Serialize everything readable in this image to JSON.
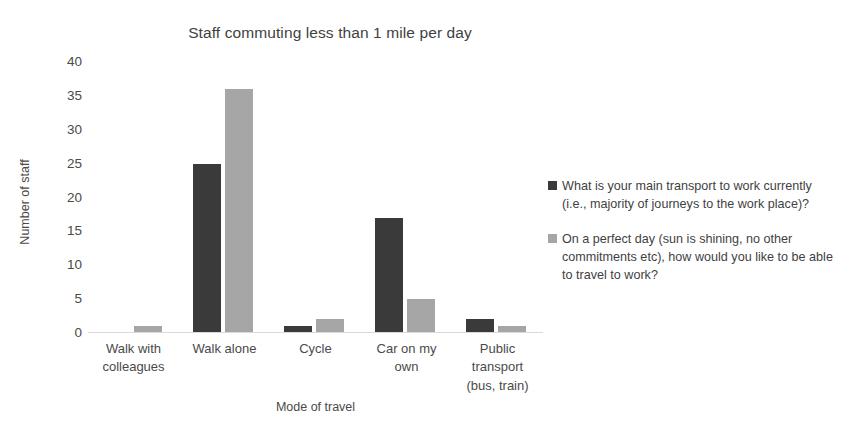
{
  "chart_data": {
    "type": "bar",
    "title": "Staff commuting less than 1 mile per day",
    "xlabel": "Mode of travel",
    "ylabel": "Number of staff",
    "categories": [
      "Walk with colleagues",
      "Walk alone",
      "Cycle",
      "Car on my own",
      "Public transport (bus, train)"
    ],
    "category_lines": [
      [
        "Walk with",
        "colleagues"
      ],
      [
        "Walk alone"
      ],
      [
        "Cycle"
      ],
      [
        "Car on my",
        "own"
      ],
      [
        "Public",
        "transport",
        "(bus, train)"
      ]
    ],
    "series": [
      {
        "name": "What is your main transport to work currently (i.e., majority of journeys to the work place)?",
        "color": "#3a3a3a",
        "values": [
          0,
          25,
          1,
          17,
          2
        ]
      },
      {
        "name": "On a perfect day (sun is shining, no other commitments etc), how would you like to be able to travel to work?",
        "color": "#a6a6a6",
        "values": [
          1,
          36,
          2,
          5,
          1
        ]
      }
    ],
    "yticks": [
      0,
      5,
      10,
      15,
      20,
      25,
      30,
      35,
      40
    ],
    "ylim": [
      0,
      40
    ],
    "grid": false,
    "legend_position": "right"
  },
  "legend": {
    "entries": [
      {
        "label": "What is your main transport to work currently (i.e., majority of journeys to the work place)?",
        "color": "#3a3a3a"
      },
      {
        "label": "On a perfect day (sun is shining, no other commitments etc), how would you like to be able to travel to work?",
        "color": "#a6a6a6"
      }
    ]
  }
}
